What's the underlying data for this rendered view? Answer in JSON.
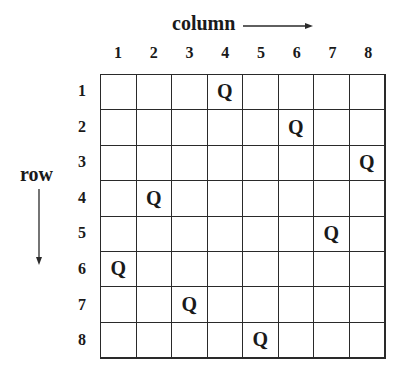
{
  "labels": {
    "column_axis": "column",
    "row_axis": "row"
  },
  "column_numbers": [
    "1",
    "2",
    "3",
    "4",
    "5",
    "6",
    "7",
    "8"
  ],
  "row_numbers": [
    "1",
    "2",
    "3",
    "4",
    "5",
    "6",
    "7",
    "8"
  ],
  "queen_symbol": "Q",
  "queen_columns_by_row": [
    4,
    6,
    8,
    2,
    7,
    1,
    3,
    5
  ],
  "board": {
    "size": 8,
    "line_color": "#2a2a2a",
    "background": "#ffffff"
  }
}
